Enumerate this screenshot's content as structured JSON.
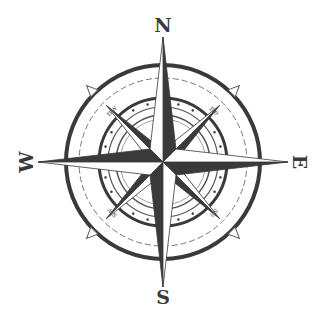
{
  "image": {
    "subject": "compass rose",
    "colors": {
      "background": "#ffffff",
      "ink": "#3a3a3a",
      "light_ink": "#777777"
    }
  },
  "compass": {
    "cardinals": {
      "north": "N",
      "east": "E",
      "south": "S",
      "west": "W"
    },
    "intercardinals": {
      "northwest": "nw",
      "northeast": "ne",
      "southeast": "se",
      "southwest": "sw"
    }
  }
}
